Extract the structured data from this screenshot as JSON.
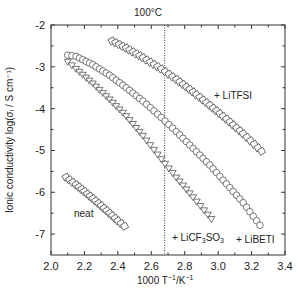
{
  "chart_data": {
    "type": "scatter",
    "title": "",
    "xlabel": "1000 T⁻¹/K⁻¹",
    "ylabel": "Ionic conductivity log(σᵢ / S cm⁻¹)",
    "xlim": [
      2.0,
      3.4
    ],
    "ylim": [
      -7.5,
      -2
    ],
    "xticks": [
      "2.0",
      "2.2",
      "2.4",
      "2.6",
      "2.8",
      "3.0",
      "3.2",
      "3.4"
    ],
    "yticks": [
      "-2",
      "-3",
      "-4",
      "-5",
      "-6",
      "-7"
    ],
    "grid": false,
    "legend_position": "inline annotations",
    "reference_line": {
      "x": 2.68,
      "label": "100°C",
      "style": "dotted"
    },
    "series": [
      {
        "name": "+ LiTFSI",
        "marker": "square",
        "x": [
          2.365,
          2.45,
          2.55,
          2.66,
          2.75,
          2.85,
          2.95,
          3.05,
          3.15,
          3.26
        ],
        "y": [
          -2.38,
          -2.55,
          -2.78,
          -3.05,
          -3.3,
          -3.6,
          -3.92,
          -4.25,
          -4.6,
          -5.02
        ]
      },
      {
        "name": "+ LiBETI",
        "marker": "circle",
        "x": [
          2.1,
          2.15,
          2.25,
          2.35,
          2.45,
          2.55,
          2.66,
          2.75,
          2.85,
          2.95,
          3.05,
          3.15,
          3.25
        ],
        "y": [
          -2.72,
          -2.75,
          -2.95,
          -3.2,
          -3.5,
          -3.82,
          -4.21,
          -4.55,
          -4.95,
          -5.35,
          -5.8,
          -6.25,
          -6.79
        ]
      },
      {
        "name": "+ LiCF₃SO₃",
        "marker": "triangle",
        "x": [
          2.1,
          2.15,
          2.25,
          2.35,
          2.45,
          2.55,
          2.66,
          2.75,
          2.85,
          2.96
        ],
        "y": [
          -2.88,
          -3.05,
          -3.4,
          -3.78,
          -4.18,
          -4.65,
          -5.21,
          -5.65,
          -6.12,
          -6.64
        ]
      },
      {
        "name": "neat",
        "marker": "square",
        "x": [
          2.09,
          2.15,
          2.2,
          2.25,
          2.3,
          2.35,
          2.4,
          2.44
        ],
        "y": [
          -5.64,
          -5.82,
          -5.98,
          -6.15,
          -6.32,
          -6.5,
          -6.68,
          -6.81
        ]
      }
    ],
    "annotations": [
      {
        "text": "+ LiTFSI",
        "x": 3.08,
        "y": -3.75
      },
      {
        "text": "neat",
        "x": 2.18,
        "y": -6.55
      },
      {
        "text": "+ LiCF₃SO₃",
        "x": 2.72,
        "y": -7.1
      },
      {
        "text": "+ LiBETI",
        "x": 3.0,
        "y": -7.15
      }
    ]
  },
  "labels": {
    "ref_line": "100°C",
    "xlabel_main": "1000 T",
    "xlabel_sup1": "−1",
    "xlabel_mid": "/K",
    "xlabel_sup2": "−1",
    "ylabel": "Ionic conductivity log(σᵢ / S cm⁻¹)",
    "ann_litfsi": "+ LiTFSI",
    "ann_neat": "neat",
    "ann_licf3_a": "+ LiCF",
    "ann_licf3_b": "3",
    "ann_licf3_c": "SO",
    "ann_licf3_d": "3",
    "ann_libeti": "+ LiBETI"
  }
}
